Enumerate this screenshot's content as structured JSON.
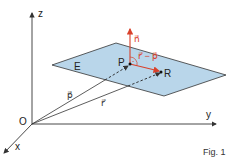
{
  "figure": {
    "caption": "Fig. 1",
    "axes": {
      "x_label": "x",
      "y_label": "y",
      "z_label": "z",
      "origin_label": "O"
    },
    "plane": {
      "label": "E",
      "fill": "#b9d6ea",
      "stroke": "#333333"
    },
    "points": {
      "P": "P",
      "R": "R"
    },
    "vectors": {
      "p": "p⃗",
      "r": "r⃗",
      "n": "n⃗",
      "r_minus_p": "r⃗ − p⃗"
    },
    "colors": {
      "accent": "#d9412b",
      "axis": "#333333",
      "plane_fill": "#b9d6ea"
    }
  }
}
